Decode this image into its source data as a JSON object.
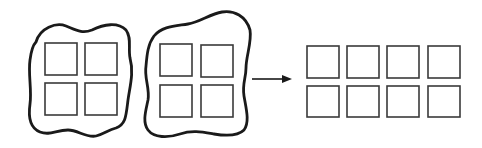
{
  "diagram": {
    "colors": {
      "background": "#ffffff",
      "stroke": "#1a1a1a",
      "square_stroke": "#3a3a3a"
    },
    "groups": [
      {
        "id": "left-blob",
        "squares": [
          {
            "x": 45,
            "y": 43,
            "w": 32,
            "h": 32
          },
          {
            "x": 85,
            "y": 43,
            "w": 32,
            "h": 32
          },
          {
            "x": 45,
            "y": 83,
            "w": 32,
            "h": 32
          },
          {
            "x": 85,
            "y": 83,
            "w": 32,
            "h": 32
          }
        ]
      },
      {
        "id": "middle-blob",
        "squares": [
          {
            "x": 160,
            "y": 44,
            "w": 32,
            "h": 32
          },
          {
            "x": 201,
            "y": 45,
            "w": 32,
            "h": 32
          },
          {
            "x": 160,
            "y": 85,
            "w": 32,
            "h": 32
          },
          {
            "x": 201,
            "y": 85,
            "w": 32,
            "h": 32
          }
        ]
      }
    ],
    "arrow": {
      "x1": 252,
      "y1": 79,
      "x2": 292,
      "y2": 79,
      "direction": "right"
    },
    "result_grid": {
      "rows": 2,
      "cols": 4,
      "squares": [
        {
          "x": 307,
          "y": 46,
          "w": 32,
          "h": 32
        },
        {
          "x": 347,
          "y": 46,
          "w": 32,
          "h": 32
        },
        {
          "x": 387,
          "y": 46,
          "w": 32,
          "h": 32
        },
        {
          "x": 428,
          "y": 46,
          "w": 32,
          "h": 32
        },
        {
          "x": 307,
          "y": 86,
          "w": 32,
          "h": 31
        },
        {
          "x": 347,
          "y": 86,
          "w": 32,
          "h": 31
        },
        {
          "x": 387,
          "y": 86,
          "w": 32,
          "h": 31
        },
        {
          "x": 428,
          "y": 86,
          "w": 32,
          "h": 31
        }
      ]
    }
  }
}
